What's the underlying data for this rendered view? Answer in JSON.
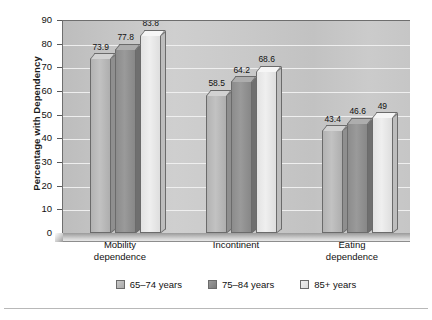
{
  "chart_data": {
    "type": "bar",
    "title": "",
    "xlabel": "",
    "ylabel": "Percentage with Dependency",
    "ylim": [
      0,
      90
    ],
    "ytick_step": 10,
    "yticks": [
      90,
      80,
      70,
      60,
      50,
      40,
      30,
      20,
      10,
      0
    ],
    "grid": true,
    "legend_position": "bottom",
    "categories": [
      "Mobility dependence",
      "Incontinent",
      "Eating dependence"
    ],
    "category_lines": [
      [
        "Mobility",
        "dependence"
      ],
      [
        "Incontinent",
        ""
      ],
      [
        "Eating",
        "dependence"
      ]
    ],
    "series": [
      {
        "name": "65–74 years",
        "values": [
          73.9,
          58.5,
          43.4
        ],
        "color": "#b8b8b8"
      },
      {
        "name": "75–84 years",
        "values": [
          77.8,
          64.2,
          46.6
        ],
        "color": "#919191"
      },
      {
        "name": "85+ years",
        "values": [
          83.8,
          68.6,
          49
        ],
        "color": "#e9e9e9"
      }
    ],
    "value_labels": [
      [
        "73.9",
        "77.8",
        "83.8"
      ],
      [
        "58.5",
        "64.2",
        "68.6"
      ],
      [
        "43.4",
        "46.6",
        "49"
      ]
    ]
  },
  "legend": {
    "items": [
      {
        "label": "65–74 years"
      },
      {
        "label": "75–84 years"
      },
      {
        "label": "85+ years"
      }
    ]
  }
}
